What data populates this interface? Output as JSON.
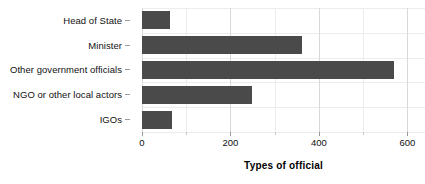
{
  "chart_data": {
    "type": "bar",
    "orientation": "horizontal",
    "title": "",
    "xlabel": "Types of official",
    "ylabel": "",
    "categories": [
      "Head of State",
      "Minister",
      "Other government officials",
      "NGO or other local actors",
      "IGOs"
    ],
    "values": [
      63,
      361,
      571,
      248,
      68
    ],
    "xlim": [
      0,
      640
    ],
    "xticks": [
      0,
      200,
      400,
      600
    ],
    "xtick_labels": [
      "0",
      "200",
      "400",
      "600"
    ],
    "minor_xticks": [
      100,
      300,
      500
    ],
    "grid": true,
    "legend": "none",
    "bar_color": "#4a4a4a",
    "gridline_color": "#d9d9d9",
    "background_color": "#ffffff"
  },
  "axis": {
    "x_title": "Types of official",
    "tick_0": "0",
    "tick_200": "200",
    "tick_400": "400",
    "tick_600": "600"
  },
  "categories": {
    "c0": "Head of State",
    "c1": "Minister",
    "c2": "Other government officials",
    "c3": "NGO or other local actors",
    "c4": "IGOs"
  }
}
